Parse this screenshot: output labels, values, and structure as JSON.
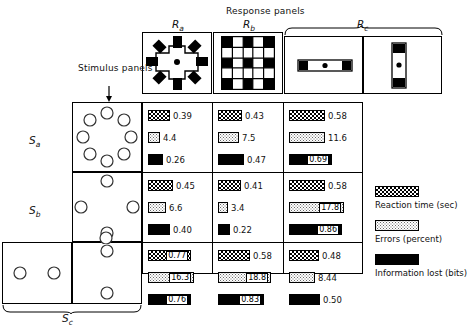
{
  "figure": {
    "response_panels_title": "Response panels",
    "stimulus_panels_note": "Stimulus panels"
  },
  "response_labels": {
    "ra": "R",
    "ra_sub": "a",
    "rb": "R",
    "rb_sub": "b",
    "rc": "R",
    "rc_sub": "c"
  },
  "stimulus_labels": {
    "sa": "S",
    "sa_sub": "a",
    "sb": "S",
    "sb_sub": "b",
    "sc": "S",
    "sc_sub": "c"
  },
  "legend": {
    "items": [
      {
        "key": "reaction-time",
        "label": "Reaction time (sec)"
      },
      {
        "key": "errors",
        "label": "Errors (percent)"
      },
      {
        "key": "information-lost",
        "label": "Information lost (bits)"
      }
    ]
  },
  "chart_data": {
    "type": "bar",
    "title": "Response panels",
    "xlabel": "",
    "ylabel": "",
    "grid": false,
    "legend_position": "right",
    "categories": [
      "Ra",
      "Rb",
      "Rc"
    ],
    "rows": [
      "Sa",
      "Sb",
      "Sc"
    ],
    "measures": [
      {
        "name": "Reaction time (sec)",
        "unit": "sec",
        "max": 1.0
      },
      {
        "name": "Errors (percent)",
        "unit": "percent",
        "max": 20.0
      },
      {
        "name": "Information lost (bits)",
        "unit": "bits",
        "max": 1.0
      }
    ],
    "cells": [
      {
        "stimulus": "Sa",
        "response": "Ra",
        "reaction_time": 0.39,
        "errors": 4.4,
        "information_lost": 0.26,
        "reaction_time_text": "0.39",
        "errors_text": "4.4",
        "information_lost_text": "0.26",
        "reaction_time_inset": false,
        "errors_inset": false,
        "information_lost_inset": false
      },
      {
        "stimulus": "Sa",
        "response": "Rb",
        "reaction_time": 0.43,
        "errors": 7.5,
        "information_lost": 0.47,
        "reaction_time_text": "0.43",
        "errors_text": "7.5",
        "information_lost_text": "0.47",
        "reaction_time_inset": false,
        "errors_inset": false,
        "information_lost_inset": false
      },
      {
        "stimulus": "Sa",
        "response": "Rc",
        "reaction_time": 0.58,
        "errors": 11.6,
        "information_lost": 0.69,
        "reaction_time_text": "0.58",
        "errors_text": "11.6",
        "information_lost_text": "0.69",
        "reaction_time_inset": false,
        "errors_inset": false,
        "information_lost_inset": true
      },
      {
        "stimulus": "Sb",
        "response": "Ra",
        "reaction_time": 0.45,
        "errors": 6.6,
        "information_lost": 0.4,
        "reaction_time_text": "0.45",
        "errors_text": "6.6",
        "information_lost_text": "0.40",
        "reaction_time_inset": false,
        "errors_inset": false,
        "information_lost_inset": false
      },
      {
        "stimulus": "Sb",
        "response": "Rb",
        "reaction_time": 0.41,
        "errors": 3.4,
        "information_lost": 0.22,
        "reaction_time_text": "0.41",
        "errors_text": "3.4",
        "information_lost_text": "0.22",
        "reaction_time_inset": false,
        "errors_inset": false,
        "information_lost_inset": false
      },
      {
        "stimulus": "Sb",
        "response": "Rc",
        "reaction_time": 0.58,
        "errors": 17.8,
        "information_lost": 0.86,
        "reaction_time_text": "0.58",
        "errors_text": "17.8",
        "information_lost_text": "0.86",
        "reaction_time_inset": false,
        "errors_inset": true,
        "information_lost_inset": true
      },
      {
        "stimulus": "Sc",
        "response": "Ra",
        "reaction_time": 0.77,
        "errors": 16.3,
        "information_lost": 0.76,
        "reaction_time_text": "0.77",
        "errors_text": "16.3",
        "information_lost_text": "0.76",
        "reaction_time_inset": true,
        "errors_inset": true,
        "information_lost_inset": true
      },
      {
        "stimulus": "Sc",
        "response": "Rb",
        "reaction_time": 0.58,
        "errors": 18.8,
        "information_lost": 0.83,
        "reaction_time_text": "0.58",
        "errors_text": "18.8",
        "information_lost_text": "0.83",
        "reaction_time_inset": false,
        "errors_inset": true,
        "information_lost_inset": true
      },
      {
        "stimulus": "Sc",
        "response": "Rc",
        "reaction_time": 0.48,
        "errors": 8.44,
        "information_lost": 0.5,
        "reaction_time_text": "0.48",
        "errors_text": "8.44",
        "information_lost_text": "0.50",
        "reaction_time_inset": false,
        "errors_inset": false,
        "information_lost_inset": false
      }
    ]
  }
}
